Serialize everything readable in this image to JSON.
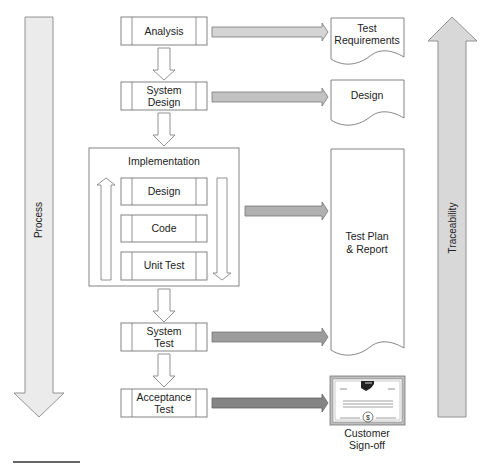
{
  "diagram": {
    "process_label": "Process",
    "traceability_label": "Traceability",
    "phases": [
      {
        "id": "analysis",
        "lines": [
          "Analysis"
        ]
      },
      {
        "id": "system-design",
        "lines": [
          "System",
          "Design"
        ]
      },
      {
        "id": "system-test",
        "lines": [
          "System",
          "Test"
        ]
      },
      {
        "id": "acceptance-test",
        "lines": [
          "Acceptance",
          "Test"
        ]
      }
    ],
    "implementation": {
      "title": "Implementation",
      "steps": [
        "Design",
        "Code",
        "Unit Test"
      ]
    },
    "artifacts": [
      {
        "id": "test-requirements",
        "lines": [
          "Test",
          "Requirements"
        ]
      },
      {
        "id": "design",
        "lines": [
          "Design"
        ]
      },
      {
        "id": "test-plan-report",
        "lines": [
          "Test Plan",
          "& Report"
        ]
      },
      {
        "id": "customer-sign-off",
        "lines": [
          "Customer",
          "Sign-off"
        ]
      }
    ],
    "icons": {
      "certificate": "certificate-icon",
      "dollar_seal": "$"
    },
    "arrow_colors": [
      "#d4d4d4",
      "#c2c2c2",
      "#b0b0b0",
      "#9c9c9c",
      "#848484"
    ],
    "big_arrow_fill": "#e0e0e0"
  }
}
